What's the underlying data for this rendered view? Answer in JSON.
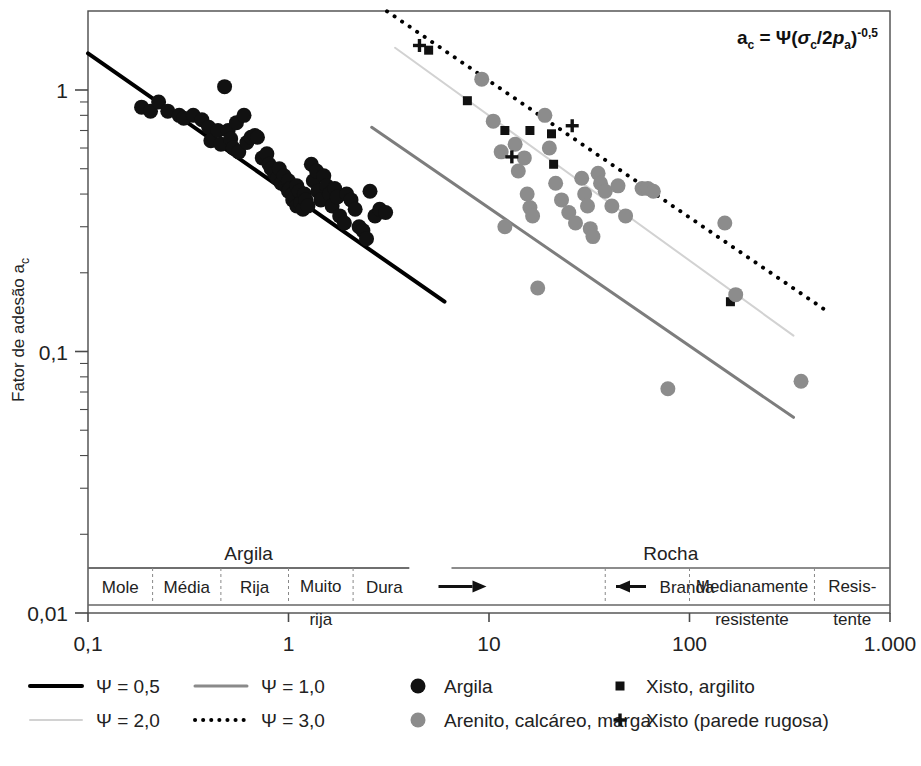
{
  "chart_data": {
    "type": "scatter",
    "title": "",
    "xlabel": "",
    "ylabel": "Fator de adesão ac",
    "ylabel_text": "Fator de adesão ac",
    "annotation": "ac = Ψ(σc/2pa)-0,5",
    "annotation_parts": {
      "a": "a",
      "a_sub": "c",
      "eq": " = ",
      "psi": "Ψ(",
      "sigma": "σ",
      "sigma_sub": "c",
      "slash": "/2",
      "p": "p",
      "p_sub": "a",
      "close": ")",
      "exp": "-0,5"
    },
    "xscale": "log",
    "yscale": "log",
    "xlim": [
      0.1,
      1000
    ],
    "ylim": [
      0.01,
      2.0
    ],
    "grid": false,
    "x_ticks": [
      {
        "value": 0.1,
        "label": "0,1"
      },
      {
        "value": 1,
        "label": "1"
      },
      {
        "value": 10,
        "label": "10"
      },
      {
        "value": 100,
        "label": "100"
      },
      {
        "value": 1000,
        "label": "1.000"
      }
    ],
    "y_ticks": [
      {
        "value": 1,
        "label": "1"
      },
      {
        "value": 0.1,
        "label": "0,1"
      },
      {
        "value": 0.01,
        "label": "0,01"
      }
    ],
    "legend_position": "below-plot",
    "series": [
      {
        "name": "Argila",
        "marker": "circle",
        "color": "#111111",
        "size": 15,
        "points": [
          [
            0.185,
            0.86
          ],
          [
            0.205,
            0.83
          ],
          [
            0.225,
            0.9
          ],
          [
            0.25,
            0.83
          ],
          [
            0.285,
            0.8
          ],
          [
            0.3,
            0.78
          ],
          [
            0.335,
            0.8
          ],
          [
            0.37,
            0.77
          ],
          [
            0.4,
            0.72
          ],
          [
            0.41,
            0.64
          ],
          [
            0.445,
            0.7
          ],
          [
            0.46,
            0.62
          ],
          [
            0.48,
            1.03
          ],
          [
            0.5,
            0.7
          ],
          [
            0.515,
            0.65
          ],
          [
            0.53,
            0.6
          ],
          [
            0.55,
            0.75
          ],
          [
            0.565,
            0.58
          ],
          [
            0.6,
            0.8
          ],
          [
            0.62,
            0.63
          ],
          [
            0.65,
            0.66
          ],
          [
            0.68,
            0.67
          ],
          [
            0.7,
            0.66
          ],
          [
            0.74,
            0.55
          ],
          [
            0.78,
            0.57
          ],
          [
            0.8,
            0.52
          ],
          [
            0.82,
            0.5
          ],
          [
            0.85,
            0.48
          ],
          [
            0.88,
            0.46
          ],
          [
            0.9,
            0.5
          ],
          [
            0.92,
            0.44
          ],
          [
            0.95,
            0.47
          ],
          [
            0.97,
            0.43
          ],
          [
            1.0,
            0.45
          ],
          [
            1.0,
            0.41
          ],
          [
            1.02,
            0.42
          ],
          [
            1.05,
            0.4
          ],
          [
            1.05,
            0.38
          ],
          [
            1.08,
            0.39
          ],
          [
            1.1,
            0.43
          ],
          [
            1.1,
            0.36
          ],
          [
            1.13,
            0.41
          ],
          [
            1.15,
            0.37
          ],
          [
            1.18,
            0.35
          ],
          [
            1.2,
            0.4
          ],
          [
            1.22,
            0.38
          ],
          [
            1.25,
            0.36
          ],
          [
            1.3,
            0.52
          ],
          [
            1.33,
            0.45
          ],
          [
            1.38,
            0.49
          ],
          [
            1.4,
            0.41
          ],
          [
            1.45,
            0.38
          ],
          [
            1.5,
            0.47
          ],
          [
            1.55,
            0.43
          ],
          [
            1.6,
            0.4
          ],
          [
            1.65,
            0.36
          ],
          [
            1.7,
            0.42
          ],
          [
            1.75,
            0.39
          ],
          [
            1.8,
            0.33
          ],
          [
            1.9,
            0.31
          ],
          [
            1.95,
            0.4
          ],
          [
            2.05,
            0.38
          ],
          [
            2.15,
            0.35
          ],
          [
            2.25,
            0.3
          ],
          [
            2.35,
            0.29
          ],
          [
            2.45,
            0.27
          ],
          [
            2.55,
            0.41
          ],
          [
            2.7,
            0.33
          ],
          [
            2.85,
            0.35
          ],
          [
            3.05,
            0.34
          ]
        ]
      },
      {
        "name": "Xisto, argilito",
        "marker": "square",
        "color": "#111111",
        "size": 9,
        "points": [
          [
            5.0,
            1.42
          ],
          [
            7.8,
            0.91
          ],
          [
            12.0,
            0.7
          ],
          [
            16.0,
            0.7
          ],
          [
            20.5,
            0.68
          ],
          [
            21.0,
            0.52
          ],
          [
            160.0,
            0.155
          ]
        ]
      },
      {
        "name": "Arenito, calcáreo, marga",
        "marker": "circle",
        "color": "#8c8c8c",
        "size": 15,
        "points": [
          [
            9.2,
            1.1
          ],
          [
            10.5,
            0.76
          ],
          [
            11.5,
            0.58
          ],
          [
            12.0,
            0.3
          ],
          [
            13.5,
            0.62
          ],
          [
            14.0,
            0.49
          ],
          [
            15.0,
            0.55
          ],
          [
            15.5,
            0.4
          ],
          [
            16.0,
            0.355
          ],
          [
            16.5,
            0.33
          ],
          [
            17.5,
            0.175
          ],
          [
            19.0,
            0.8
          ],
          [
            20.0,
            0.6
          ],
          [
            21.5,
            0.44
          ],
          [
            23.0,
            0.38
          ],
          [
            25.0,
            0.34
          ],
          [
            27.0,
            0.31
          ],
          [
            29.0,
            0.46
          ],
          [
            30.0,
            0.4
          ],
          [
            31.0,
            0.36
          ],
          [
            32.0,
            0.295
          ],
          [
            33.0,
            0.275
          ],
          [
            35.0,
            0.48
          ],
          [
            36.0,
            0.44
          ],
          [
            38.0,
            0.41
          ],
          [
            41.0,
            0.36
          ],
          [
            44.0,
            0.43
          ],
          [
            48.0,
            0.33
          ],
          [
            58.0,
            0.42
          ],
          [
            62.0,
            0.42
          ],
          [
            66.0,
            0.41
          ],
          [
            78.0,
            0.072
          ],
          [
            150.0,
            0.31
          ],
          [
            170.0,
            0.165
          ],
          [
            360.0,
            0.077
          ]
        ]
      },
      {
        "name": "Xisto (parede rugosa)",
        "marker": "plus",
        "color": "#111111",
        "size": 13,
        "points": [
          [
            4.5,
            1.48
          ],
          [
            13.0,
            0.555
          ],
          [
            26.0,
            0.73
          ]
        ]
      }
    ],
    "trend_lines": [
      {
        "name": "Ψ = 0,5",
        "style": "solid",
        "color": "#000000",
        "width": 4,
        "x0": 0.1,
        "y0": 1.38,
        "x1": 6.0,
        "y1": 0.155
      },
      {
        "name": "Ψ = 1,0",
        "style": "solid",
        "color": "#7d7d7d",
        "width": 3,
        "x0": 2.6,
        "y0": 0.72,
        "x1": 330.0,
        "y1": 0.056
      },
      {
        "name": "Ψ = 2,0",
        "style": "solid",
        "color": "#d2d2d2",
        "width": 2,
        "x0": 3.4,
        "y0": 1.45,
        "x1": 330.0,
        "y1": 0.115
      },
      {
        "name": "Ψ = 3,0",
        "style": "dotted",
        "color": "#000000",
        "width": 4,
        "x0": 3.1,
        "y0": 2.0,
        "x1": 470.0,
        "y1": 0.145
      }
    ],
    "x_band_groups": [
      {
        "label": "Argila",
        "x0": 0.1,
        "x1": 4.0
      },
      {
        "label": "Rocha",
        "x0": 6.5,
        "x1": 1000
      }
    ],
    "x_bands": [
      {
        "label": "Mole",
        "x0": 0.1,
        "x1": 0.21
      },
      {
        "label": "Média",
        "x0": 0.21,
        "x1": 0.46
      },
      {
        "label": "Rija",
        "x0": 0.46,
        "x1": 1.0
      },
      {
        "label": "Muito rija",
        "x0": 1.0,
        "x1": 2.1
      },
      {
        "label": "Dura",
        "x0": 2.1,
        "x1": 4.3
      },
      {
        "label": "",
        "x0": 4.3,
        "x1": 38.0,
        "arrow": "right"
      },
      {
        "label": "Branda",
        "x0": 38.0,
        "x1": 100.0,
        "arrow": "left"
      },
      {
        "label": "Medianamente resistente",
        "x0": 100.0,
        "x1": 420.0
      },
      {
        "label": "Resis-tente",
        "x0": 420.0,
        "x1": 1000.0
      }
    ],
    "band_label_wraps": {
      "Muito rija": [
        "Muito",
        "rija"
      ],
      "Medianamente resistente": [
        "Medianamente",
        "resistente"
      ],
      "Resis-tente": [
        "Resis-",
        "tente"
      ]
    }
  },
  "legend": {
    "lines": [
      {
        "label": "Ψ = 0,5",
        "style": "solid",
        "color": "#000000",
        "width": 4
      },
      {
        "label": "Ψ = 1,0",
        "style": "solid",
        "color": "#8a8a8a",
        "width": 3
      },
      {
        "label": "Ψ = 2,0",
        "style": "solid",
        "color": "#d2d2d2",
        "width": 2
      },
      {
        "label": "Ψ = 3,0",
        "style": "dotted",
        "color": "#000000",
        "width": 4
      }
    ],
    "markers": [
      {
        "label": "Argila",
        "marker": "circle",
        "color": "#111111",
        "size": 15
      },
      {
        "label": "Xisto, argilito",
        "marker": "square",
        "color": "#111111",
        "size": 9
      },
      {
        "label": "Arenito, calcáreo, marga",
        "marker": "circle",
        "color": "#8c8c8c",
        "size": 15
      },
      {
        "label": "Xisto (parede rugosa)",
        "marker": "plus",
        "color": "#111111",
        "size": 13
      }
    ]
  },
  "caption": {
    "text": ""
  }
}
